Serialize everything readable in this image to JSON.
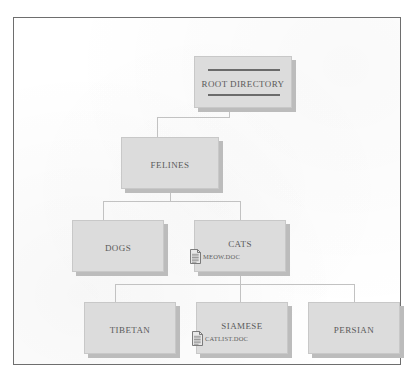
{
  "diagram": {
    "type": "directory-tree",
    "nodes": [
      {
        "id": "root",
        "label": "ROOT DIRECTORY",
        "level": 0,
        "has_rules": true,
        "x": 180,
        "y": 38,
        "w": 98,
        "h": 52,
        "label_y": 22
      },
      {
        "id": "felines",
        "label": "FELINES",
        "level": 1,
        "has_rules": false,
        "x": 107,
        "y": 119,
        "w": 98,
        "h": 52,
        "label_y": 22
      },
      {
        "id": "dogs",
        "label": "DOGS",
        "level": 2,
        "has_rules": false,
        "x": 58,
        "y": 202,
        "w": 92,
        "h": 52,
        "label_y": 22
      },
      {
        "id": "cats",
        "label": "CATS",
        "level": 2,
        "has_rules": false,
        "x": 180,
        "y": 202,
        "w": 92,
        "h": 52,
        "label_y": 18
      },
      {
        "id": "tibetan",
        "label": "TIBETAN",
        "level": 3,
        "has_rules": false,
        "x": 70,
        "y": 284,
        "w": 92,
        "h": 52,
        "label_y": 22
      },
      {
        "id": "siamese",
        "label": "SIAMESE",
        "level": 3,
        "has_rules": false,
        "x": 182,
        "y": 284,
        "w": 92,
        "h": 52,
        "label_y": 18
      },
      {
        "id": "persian",
        "label": "PERSIAN",
        "level": 3,
        "has_rules": false,
        "x": 294,
        "y": 284,
        "w": 92,
        "h": 52,
        "label_y": 22
      }
    ],
    "files": [
      {
        "id": "meow-doc",
        "name": "MEOW.DOC",
        "parent": "cats",
        "icon": "document-icon",
        "x": 176,
        "y": 231
      },
      {
        "id": "catlist-doc",
        "name": "CATLIST.DOC",
        "parent": "siamese",
        "icon": "document-icon",
        "x": 178,
        "y": 313
      }
    ],
    "edges": [
      {
        "from": "root",
        "to": "felines"
      },
      {
        "from": "felines",
        "to": "dogs"
      },
      {
        "from": "felines",
        "to": "cats"
      },
      {
        "from": "cats",
        "to": "tibetan"
      },
      {
        "from": "cats",
        "to": "siamese"
      },
      {
        "from": "cats",
        "to": "persian"
      }
    ]
  },
  "colors": {
    "box_fill": "#dcdcdc",
    "box_border": "#c8c8c8",
    "box_shadow": "#bcbcbc",
    "connector": "#c2c2c2",
    "text": "#5a5a5a",
    "rule": "#6b6b6b",
    "frame": "#6e6e6e",
    "page": "#ffffff"
  }
}
